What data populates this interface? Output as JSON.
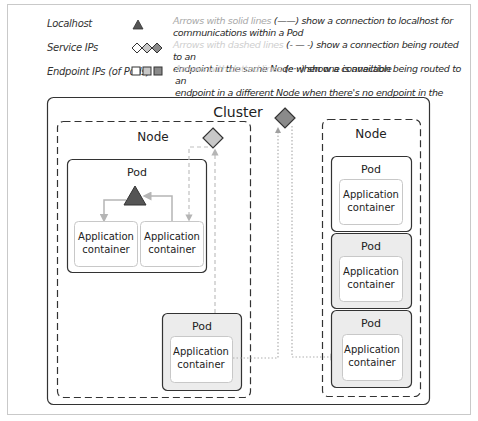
{
  "legend": {
    "items": [
      {
        "label": "Localhost",
        "symbol": "triangle",
        "symbol_colors": [
          "#555555"
        ]
      },
      {
        "label": "Service IPs",
        "symbol": "diamonds",
        "symbol_colors": [
          "#ffffff",
          "#c8c8c8",
          "#8a8a8a"
        ]
      },
      {
        "label": "Endpoint IPs (of Pods)",
        "symbol": "squares",
        "symbol_colors": [
          "#ffffff",
          "#c8c8c8",
          "#8a8a8a"
        ]
      }
    ],
    "descriptions": [
      {
        "lead": "Arrows with solid lines",
        "rest": " (——) show a connection to localhost for",
        "line2": "communications  within a Pod"
      },
      {
        "lead": "Arrows with dashed lines",
        "rest": " (- — -) show a connection being routed to an",
        "line2": "endpoint in the same Node when one is available"
      },
      {
        "lead": "Arrows with dotted lines",
        "rest": " (·····) show a connection being routed to an",
        "line2": "endpoint  in a different Node when there's no endpoint in the same Node"
      }
    ]
  },
  "diagram": {
    "cluster_label": "Cluster",
    "left_node": {
      "label": "Node",
      "pod_multi": {
        "label": "Pod",
        "containers": [
          {
            "line1": "Application",
            "line2": "container"
          },
          {
            "line1": "Application",
            "line2": "container"
          }
        ]
      },
      "pod_single": {
        "label": "Pod",
        "container": {
          "line1": "Application",
          "line2": "container"
        }
      }
    },
    "right_node": {
      "label": "Node",
      "pods": [
        {
          "label": "Pod",
          "container": {
            "line1": "Application",
            "line2": "container"
          }
        },
        {
          "label": "Pod",
          "container": {
            "line1": "Application",
            "line2": "container"
          }
        },
        {
          "label": "Pod",
          "container": {
            "line1": "Application",
            "line2": "container"
          }
        }
      ]
    }
  },
  "colors": {
    "localhost": "#555555",
    "service_light": "#c8c8c8",
    "service_dark": "#8a8a8a",
    "pod_gray_fill": "#ececec",
    "arrow_gray": "#b5b5b5"
  }
}
